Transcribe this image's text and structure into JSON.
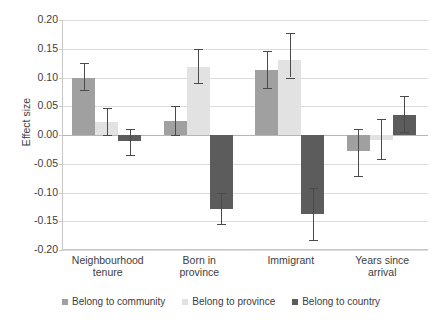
{
  "chart_data": {
    "type": "bar",
    "title": "",
    "xlabel": "",
    "ylabel": "Effect size",
    "ylim": [
      -0.2,
      0.2
    ],
    "yticks": [
      "0.20",
      "0.15",
      "0.10",
      "0.05",
      "0.00",
      "-0.05",
      "-0.10",
      "-0.15",
      "-0.20"
    ],
    "ytick_values": [
      0.2,
      0.15,
      0.1,
      0.05,
      0.0,
      -0.05,
      -0.1,
      -0.15,
      -0.2
    ],
    "grid": true,
    "legend_position": "bottom",
    "categories": [
      "Neighbourhood tenure",
      "Born in province",
      "Immigrant",
      "Years since arrival"
    ],
    "category_lines": [
      [
        "Neighbourhood",
        "tenure"
      ],
      [
        "Born in",
        "province"
      ],
      [
        "Immigrant",
        ""
      ],
      [
        "Years since",
        "arrival"
      ]
    ],
    "series": [
      {
        "name": "Belong to community",
        "color": "#a0a0a0",
        "values": [
          0.1,
          0.025,
          0.113,
          -0.027
        ],
        "ci_low": [
          0.079,
          0.0,
          0.082,
          -0.072
        ],
        "ci_high": [
          0.126,
          0.051,
          0.146,
          0.01
        ]
      },
      {
        "name": "Belong to province",
        "color": "#e2e2e2",
        "values": [
          0.022,
          0.118,
          0.13,
          -0.008
        ],
        "ci_low": [
          0.0,
          0.091,
          0.1,
          -0.042
        ],
        "ci_high": [
          0.047,
          0.15,
          0.178,
          0.028
        ]
      },
      {
        "name": "Belong to country",
        "color": "#5c5c5c",
        "values": [
          -0.01,
          -0.128,
          -0.138,
          0.035
        ],
        "ci_low": [
          -0.034,
          -0.155,
          -0.183,
          0.005
        ],
        "ci_high": [
          0.011,
          -0.1,
          -0.093,
          0.067
        ]
      }
    ]
  },
  "legend": {
    "items": [
      {
        "label": "Belong to community",
        "color": "#a0a0a0"
      },
      {
        "label": "Belong to province",
        "color": "#e2e2e2"
      },
      {
        "label": "Belong to country",
        "color": "#5c5c5c"
      }
    ]
  },
  "axis": {
    "y_title": "Effect size"
  }
}
